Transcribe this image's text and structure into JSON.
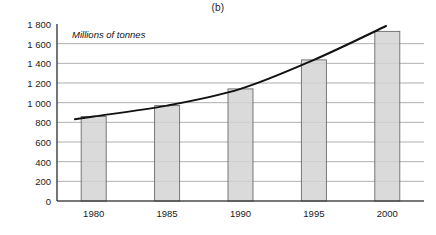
{
  "chart_data": {
    "type": "bar",
    "title": "(b)",
    "subtitle": "Millions of tonnes",
    "xlabel": "",
    "ylabel": "Millions of tonnes",
    "categories": [
      "1980",
      "1985",
      "1990",
      "1995",
      "2000"
    ],
    "values": [
      860,
      970,
      1140,
      1435,
      1725
    ],
    "series": [
      {
        "name": "Millions of tonnes",
        "type": "bar",
        "values": [
          860,
          970,
          1140,
          1435,
          1725
        ]
      },
      {
        "name": "Trend curve",
        "type": "line",
        "values": [
          860,
          970,
          1140,
          1435,
          1725
        ]
      }
    ],
    "ylim": [
      0,
      1800
    ],
    "xlim_categories": [
      "1980",
      "2000"
    ],
    "ytick_values": [
      0,
      200,
      400,
      600,
      800,
      1000,
      1200,
      1400,
      1600,
      1800
    ],
    "ytick_labels": [
      "0",
      "200",
      "400",
      "600",
      "800",
      "1 000",
      "1 200",
      "1 400",
      "1 600",
      "1 800"
    ],
    "xtick_labels": [
      "1980",
      "1985",
      "1990",
      "1995",
      "2000"
    ],
    "grid": true,
    "grid_axis": "y",
    "legend": false,
    "legend_position": "none",
    "bar_fill_color": "#d4d4d4",
    "bar_border_color": "#6b6b6b",
    "line_color": "#111111",
    "grid_color": "#9a9a9a",
    "axis_color": "#1a1a1a",
    "background_color": "#ffffff"
  }
}
